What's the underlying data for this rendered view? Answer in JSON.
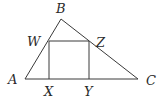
{
  "diagram": {
    "type": "geometry",
    "stroke_color": "#3a3a3a",
    "points": {
      "A": {
        "label": "A",
        "x": 25,
        "y": 79
      },
      "B": {
        "label": "B",
        "x": 61,
        "y": 19
      },
      "C": {
        "label": "C",
        "x": 138,
        "y": 79
      },
      "W": {
        "label": "W",
        "x": 49,
        "y": 41
      },
      "Z": {
        "label": "Z",
        "x": 89,
        "y": 41
      },
      "X": {
        "label": "X",
        "x": 49,
        "y": 79
      },
      "Y": {
        "label": "Y",
        "x": 89,
        "y": 79
      }
    },
    "labels": {
      "A": "A",
      "B": "B",
      "C": "C",
      "W": "W",
      "X": "X",
      "Y": "Y",
      "Z": "Z"
    },
    "segments": [
      [
        "A",
        "B"
      ],
      [
        "B",
        "C"
      ],
      [
        "A",
        "C"
      ],
      [
        "W",
        "Z"
      ],
      [
        "W",
        "X"
      ],
      [
        "Z",
        "Y"
      ]
    ]
  }
}
